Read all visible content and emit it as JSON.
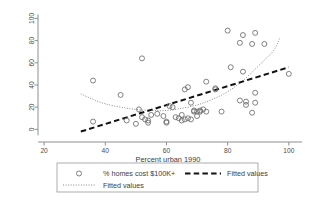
{
  "chart_data": {
    "type": "scatter",
    "title": "",
    "xlabel": "Percent urban 1990",
    "ylabel": "",
    "xlim": [
      18,
      103
    ],
    "ylim": [
      -6,
      104
    ],
    "xticks": [
      20,
      40,
      60,
      80,
      100
    ],
    "yticks": [
      0,
      20,
      40,
      60,
      80,
      100
    ],
    "grid": false,
    "legend_position": "below",
    "series": [
      {
        "name": "% homes cost $100K+",
        "marker": "open-circle",
        "type": "scatter",
        "points": [
          [
            36,
            44
          ],
          [
            36,
            7
          ],
          [
            45,
            31
          ],
          [
            47,
            8
          ],
          [
            50,
            5
          ],
          [
            51,
            18
          ],
          [
            52,
            64
          ],
          [
            52,
            11
          ],
          [
            53,
            9
          ],
          [
            54,
            8
          ],
          [
            54,
            6
          ],
          [
            55,
            13
          ],
          [
            57,
            14
          ],
          [
            59,
            12
          ],
          [
            60,
            7
          ],
          [
            60,
            6
          ],
          [
            61,
            21
          ],
          [
            62,
            20
          ],
          [
            63,
            11
          ],
          [
            64,
            10
          ],
          [
            65,
            8
          ],
          [
            65,
            13
          ],
          [
            66,
            36
          ],
          [
            66,
            9
          ],
          [
            67,
            38
          ],
          [
            67,
            10
          ],
          [
            68,
            24
          ],
          [
            68,
            9
          ],
          [
            69,
            16
          ],
          [
            69,
            17
          ],
          [
            70,
            16
          ],
          [
            70,
            12
          ],
          [
            71,
            17
          ],
          [
            71,
            16
          ],
          [
            72,
            18
          ],
          [
            73,
            43
          ],
          [
            73,
            16
          ],
          [
            76,
            36
          ],
          [
            76,
            37
          ],
          [
            78,
            16
          ],
          [
            80,
            89
          ],
          [
            81,
            56
          ],
          [
            84,
            78
          ],
          [
            84,
            26
          ],
          [
            85,
            85
          ],
          [
            85,
            52
          ],
          [
            86,
            25
          ],
          [
            86,
            22
          ],
          [
            88,
            77
          ],
          [
            88,
            15
          ],
          [
            89,
            87
          ],
          [
            89,
            33
          ],
          [
            89,
            24
          ],
          [
            92,
            77
          ],
          [
            100,
            50
          ]
        ]
      },
      {
        "name": "Fitted values",
        "type": "line",
        "style": "dashed",
        "points": [
          [
            32,
            -2
          ],
          [
            100,
            56
          ]
        ]
      },
      {
        "name": "Fitted values",
        "type": "line",
        "style": "dotted",
        "points": [
          [
            32,
            32
          ],
          [
            36,
            27
          ],
          [
            40,
            23
          ],
          [
            45,
            20
          ],
          [
            50,
            18
          ],
          [
            55,
            17
          ],
          [
            60,
            17
          ],
          [
            65,
            19
          ],
          [
            70,
            22
          ],
          [
            75,
            27
          ],
          [
            80,
            34
          ],
          [
            85,
            44
          ],
          [
            90,
            57
          ],
          [
            95,
            71
          ],
          [
            97,
            82
          ]
        ]
      }
    ],
    "legend_entries": [
      {
        "label": "% homes cost $100K+",
        "symbol": "circle"
      },
      {
        "label": "Fitted values",
        "symbol": "dashed-line"
      },
      {
        "label": "Fitted values",
        "symbol": "dotted-line"
      }
    ]
  }
}
